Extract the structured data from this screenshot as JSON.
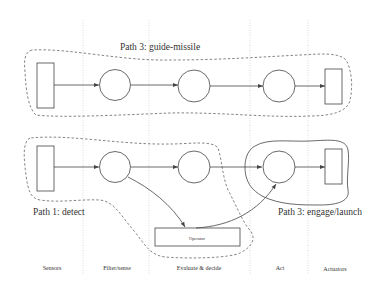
{
  "diagram": {
    "paths": {
      "path3_guide": "Path 3: guide-missile",
      "path1_detect": "Path 1: detect",
      "path3_engage": "Path 3: engage/launch"
    },
    "operator_label": "Operator",
    "columns": [
      "Sensors",
      "Filter/sense",
      "Evaluate & decide",
      "Act",
      "Actuators"
    ],
    "colors": {
      "stroke": "#444444",
      "grid": "#cccccc",
      "dashed": "#666666"
    }
  }
}
